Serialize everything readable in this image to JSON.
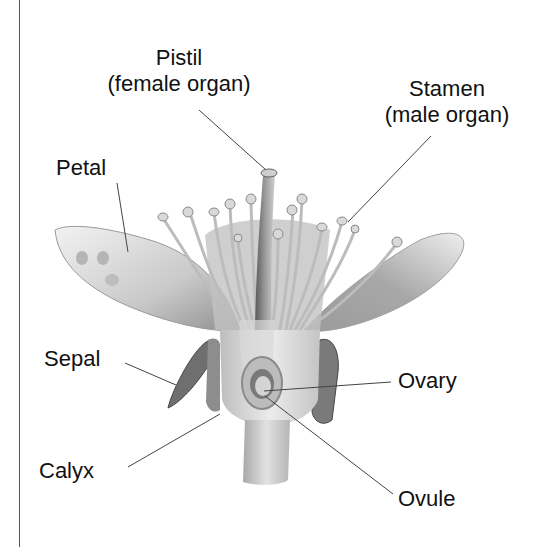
{
  "diagram": {
    "labels": {
      "pistil": {
        "title": "Pistil",
        "subtitle": "(female organ)"
      },
      "stamen": {
        "title": "Stamen",
        "subtitle": "(male organ)"
      },
      "petal": {
        "title": "Petal"
      },
      "sepal": {
        "title": "Sepal"
      },
      "calyx": {
        "title": "Calyx"
      },
      "ovary": {
        "title": "Ovary"
      },
      "ovule": {
        "title": "Ovule"
      }
    },
    "colors": {
      "ink": "#111111",
      "leader": "#444444",
      "petal_light": "#e6e6e6",
      "petal_dark": "#9a9a9a",
      "sepal": "#6f6f6f",
      "stem": "#c8c8c8"
    }
  }
}
